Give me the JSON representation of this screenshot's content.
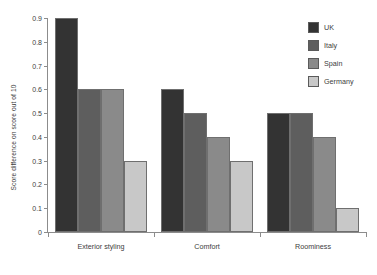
{
  "chart_data": {
    "type": "bar",
    "title": "",
    "xlabel": "",
    "ylabel": "Score difference on score out of 10",
    "categories": [
      "Exterior styling",
      "Comfort",
      "Roominess"
    ],
    "series": [
      {
        "name": "UK",
        "color": "#333333",
        "values": [
          0.9,
          0.6,
          0.5
        ]
      },
      {
        "name": "Italy",
        "color": "#5e5e5e",
        "values": [
          0.6,
          0.5,
          0.5
        ]
      },
      {
        "name": "Spain",
        "color": "#8a8a8a",
        "values": [
          0.6,
          0.4,
          0.4
        ]
      },
      {
        "name": "Germany",
        "color": "#c8c8c8",
        "values": [
          0.3,
          0.3,
          0.1
        ]
      }
    ],
    "ylim": [
      0,
      0.9
    ],
    "yticks": [
      "0",
      "0.1",
      "0.2",
      "0.3",
      "0.4",
      "0.5",
      "0.6",
      "0.7",
      "0.8",
      "0.9"
    ],
    "ytick_values": [
      0,
      0.1,
      0.2,
      0.3,
      0.4,
      0.5,
      0.6,
      0.7,
      0.8,
      0.9
    ],
    "grid": false,
    "legend_position": "top-right"
  }
}
